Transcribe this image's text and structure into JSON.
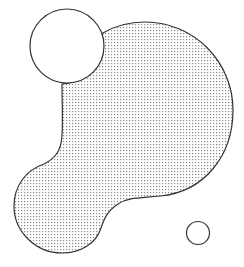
{
  "figure": {
    "width": 244,
    "height": 267,
    "background": "#ffffff",
    "stroke_color": "#333333",
    "dot_color": "#8a8a8a",
    "shapes": [
      {
        "name": "large-dotted-blob",
        "fill": "dotted",
        "description": "Large circle merged with a smaller lower-left lobe"
      },
      {
        "name": "white-circle-top-left",
        "fill": "#ffffff",
        "cx": 67,
        "cy": 46,
        "r": 37
      },
      {
        "name": "small-circle-bottom-right",
        "fill": "#ffffff",
        "cx": 198,
        "cy": 233,
        "r": 11.5
      }
    ]
  }
}
